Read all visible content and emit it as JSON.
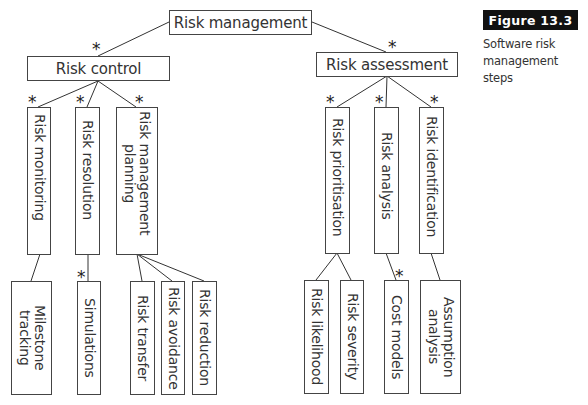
{
  "figure": {
    "badge": "Figure  13.3",
    "caption": "Software risk management steps"
  },
  "root": {
    "label": "Risk management"
  },
  "branches": [
    {
      "label": "Risk control",
      "children": [
        {
          "label": "Risk monitoring",
          "children": [
            {
              "label": "Milestone\ntracking"
            }
          ]
        },
        {
          "label": "Risk resolution",
          "children": [
            {
              "label": "Simulations"
            }
          ]
        },
        {
          "label": "Risk management\nplanning",
          "children": [
            {
              "label": "Risk transfer"
            },
            {
              "label": "Risk avoidance"
            },
            {
              "label": "Risk reduction"
            }
          ]
        }
      ]
    },
    {
      "label": "Risk assessment",
      "children": [
        {
          "label": "Risk prioritisation",
          "children": [
            {
              "label": "Risk likelihood"
            },
            {
              "label": "Risk severity"
            }
          ]
        },
        {
          "label": "Risk analysis",
          "children": [
            {
              "label": "Cost models"
            }
          ]
        },
        {
          "label": "Risk identification",
          "children": [
            {
              "label": "Assumption\nanalysis"
            }
          ]
        }
      ]
    }
  ],
  "multiplicity_marker": "*"
}
